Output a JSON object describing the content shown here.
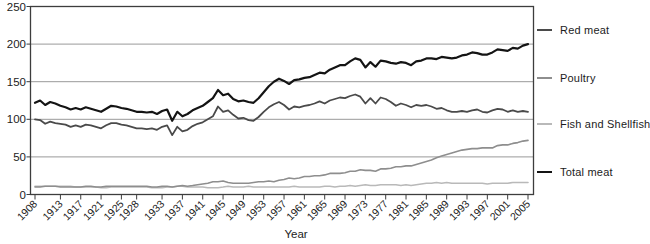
{
  "chart_data": {
    "type": "line",
    "title": "",
    "xlabel": "Year",
    "ylabel": "",
    "ylim": [
      0,
      250
    ],
    "yticks": [
      0,
      50,
      100,
      150,
      200,
      250
    ],
    "grid": "horizontal",
    "legend_position": "right",
    "x_start": 1908,
    "x_end": 2005,
    "x_step": 1,
    "xtick_labels": [
      "1908",
      "1913",
      "1917",
      "1921",
      "1925",
      "1928",
      "1933",
      "1937",
      "1941",
      "1945",
      "1949",
      "1953",
      "1957",
      "1961",
      "1965",
      "1969",
      "1973",
      "1977",
      "1981",
      "1985",
      "1989",
      "1993",
      "1997",
      "2001",
      "2005"
    ],
    "series": [
      {
        "name": "Red meat",
        "color": "#4a4a4a",
        "width": 1.8,
        "values": [
          100,
          99,
          94,
          97,
          95,
          94,
          93,
          90,
          92,
          90,
          93,
          92,
          90,
          88,
          92,
          95,
          95,
          93,
          92,
          90,
          88,
          88,
          87,
          88,
          86,
          90,
          92,
          79,
          90,
          84,
          86,
          91,
          94,
          96,
          100,
          104,
          117,
          110,
          112,
          106,
          101,
          102,
          99,
          98,
          103,
          110,
          116,
          120,
          123,
          119,
          113,
          117,
          116,
          118,
          119,
          121,
          124,
          121,
          125,
          127,
          129,
          128,
          131,
          133,
          130,
          121,
          128,
          121,
          129,
          127,
          123,
          118,
          121,
          119,
          116,
          119,
          118,
          119,
          117,
          114,
          115,
          112,
          110,
          110,
          111,
          110,
          112,
          113,
          110,
          109,
          112,
          114,
          113,
          110,
          112,
          110,
          111,
          110
        ]
      },
      {
        "name": "Poultry",
        "color": "#8e8e8e",
        "width": 1.6,
        "values": [
          10,
          10,
          11,
          11,
          11,
          10,
          10,
          10,
          10,
          10,
          11,
          11,
          10,
          10,
          11,
          11,
          11,
          11,
          11,
          11,
          11,
          11,
          11,
          10,
          10,
          11,
          11,
          10,
          11,
          12,
          11,
          12,
          13,
          14,
          15,
          17,
          17,
          18,
          16,
          15,
          15,
          15,
          15,
          16,
          17,
          17,
          18,
          17,
          19,
          20,
          22,
          21,
          22,
          24,
          24,
          25,
          25,
          26,
          28,
          28,
          28,
          29,
          31,
          31,
          33,
          32,
          32,
          31,
          34,
          34,
          35,
          37,
          37,
          38,
          38,
          40,
          42,
          44,
          46,
          49,
          51,
          53,
          55,
          57,
          59,
          60,
          61,
          61,
          62,
          62,
          62,
          65,
          66,
          66,
          68,
          69,
          71,
          72
        ]
      },
      {
        "name": "Fish and Shellfish",
        "color": "#b9b9b9",
        "width": 1.6,
        "values": [
          11,
          11,
          11,
          11,
          11,
          11,
          11,
          11,
          10,
          10,
          10,
          10,
          10,
          9,
          9,
          10,
          10,
          10,
          10,
          10,
          10,
          10,
          10,
          9,
          9,
          9,
          10,
          10,
          11,
          11,
          10,
          10,
          10,
          10,
          9,
          9,
          9,
          10,
          11,
          10,
          10,
          10,
          11,
          10,
          10,
          10,
          10,
          10,
          10,
          10,
          10,
          11,
          10,
          10,
          10,
          10,
          10,
          11,
          11,
          10,
          11,
          11,
          12,
          11,
          12,
          13,
          12,
          12,
          13,
          13,
          13,
          13,
          12,
          13,
          12,
          13,
          14,
          15,
          15,
          16,
          15,
          16,
          15,
          15,
          15,
          15,
          15,
          15,
          15,
          14,
          15,
          15,
          15,
          15,
          16,
          16,
          16,
          16
        ]
      },
      {
        "name": "Total meat",
        "color": "#141414",
        "width": 2.2,
        "values": [
          122,
          125,
          119,
          123,
          121,
          118,
          116,
          113,
          115,
          113,
          116,
          114,
          112,
          110,
          114,
          118,
          117,
          115,
          114,
          112,
          110,
          110,
          109,
          110,
          107,
          111,
          113,
          98,
          110,
          104,
          107,
          112,
          115,
          118,
          123,
          128,
          139,
          132,
          134,
          127,
          124,
          125,
          123,
          122,
          128,
          136,
          144,
          150,
          154,
          151,
          147,
          152,
          153,
          155,
          156,
          159,
          162,
          161,
          166,
          169,
          172,
          172,
          177,
          181,
          179,
          169,
          176,
          170,
          178,
          177,
          175,
          174,
          176,
          175,
          172,
          177,
          178,
          181,
          181,
          180,
          183,
          182,
          181,
          182,
          185,
          186,
          189,
          188,
          186,
          186,
          189,
          193,
          192,
          191,
          195,
          194,
          198,
          200
        ]
      }
    ],
    "colors": {
      "axis": "#3d3d3d",
      "grid": "#999999",
      "text": "#1c1c1c",
      "background": "#ffffff"
    }
  }
}
